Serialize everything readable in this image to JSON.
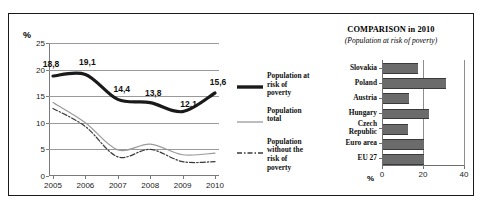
{
  "figure": {
    "border_color": "#1a1a1a",
    "background": "#ffffff"
  },
  "line_chart": {
    "unit_label": "%",
    "legend": [
      {
        "label": "Population at risk of poverty",
        "style": "thick-solid-black",
        "color": "#1a1a1a"
      },
      {
        "label": "Population total",
        "style": "thin-solid-gray",
        "color": "#9a9a9a"
      },
      {
        "label": "Population without the risk of poverty",
        "style": "dash-dot-dark",
        "color": "#3a3a3a"
      }
    ]
  },
  "bar_chart": {
    "title": "COMPARISON in 2010",
    "subtitle": "(Population at risk of poverty)",
    "unit_label": "%"
  },
  "chart_data": [
    {
      "type": "line",
      "title": "",
      "xlabel": "",
      "ylabel": "%",
      "x": [
        2005,
        2006,
        2007,
        2008,
        2009,
        2010
      ],
      "xtick_labels": [
        "2005",
        "2006",
        "2007",
        "2008",
        "2009",
        "2010"
      ],
      "ylim": [
        0,
        25
      ],
      "yticks": [
        0,
        5,
        10,
        15,
        20,
        25
      ],
      "ytick_labels": [
        "0",
        "5",
        "10",
        "15",
        "20",
        "25"
      ],
      "grid": true,
      "legend_position": "right",
      "series": [
        {
          "name": "Population at risk of poverty",
          "values": [
            18.8,
            19.1,
            14.4,
            13.8,
            12.1,
            15.6
          ],
          "data_labels": [
            "18,8",
            "19,1",
            "14,4",
            "13,8",
            "12,1",
            "15,6"
          ],
          "color": "#1a1a1a",
          "width": 3.2,
          "dash": "none"
        },
        {
          "name": "Population total",
          "values": [
            13.8,
            10.0,
            4.9,
            6.0,
            4.0,
            4.3
          ],
          "data_labels": [],
          "color": "#9a9a9a",
          "width": 1.2,
          "dash": "none"
        },
        {
          "name": "Population without the risk of poverty",
          "values": [
            12.7,
            9.3,
            3.6,
            5.0,
            2.7,
            2.7
          ],
          "data_labels": [],
          "color": "#3a3a3a",
          "width": 1.2,
          "dash": "dash-dot"
        }
      ]
    },
    {
      "type": "bar",
      "orientation": "horizontal",
      "title": "COMPARISON in 2010",
      "subtitle": "(Population at risk of poverty)",
      "xlabel": "%",
      "ylabel": "",
      "categories": [
        "Slovakia",
        "Poland",
        "Austria",
        "Hungary",
        "Czech Republic",
        "Euro area",
        "EU 27"
      ],
      "values": [
        17.2,
        30.7,
        12.6,
        22.4,
        12.2,
        20.0,
        20.0
      ],
      "xlim": [
        0,
        40
      ],
      "xticks": [
        0,
        20,
        40
      ],
      "xtick_labels": [
        "0",
        "20",
        "40"
      ],
      "grid": true,
      "bar_color": "#6b6b6b"
    }
  ]
}
